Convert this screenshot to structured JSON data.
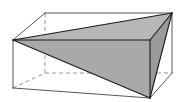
{
  "figure": {
    "background_color": "#ffffff",
    "canvas": {
      "width": 190,
      "height": 102
    },
    "colors": {
      "outline": "#1a1a1a",
      "hidden_edge": "#8a8a8a",
      "box_edge": "#444444",
      "face_top": "#b7b7b7",
      "face_front": "#a9a9a9",
      "face_right": "#9a9a9a",
      "face_left_sliver": "#8f8f8f"
    },
    "stroke_widths": {
      "solid": 1.1,
      "box": 0.9,
      "hidden": 0.9
    },
    "dash_pattern": "4,3",
    "vertices": {
      "box_front_top_left": [
        13,
        40
      ],
      "box_front_bottom_left": [
        13,
        88
      ],
      "box_front_top_right": [
        150,
        40
      ],
      "box_front_bottom_right": [
        150,
        98
      ],
      "box_back_top_left": [
        45,
        13
      ],
      "box_back_bottom_left": [
        45,
        73
      ],
      "box_back_top_right": [
        172,
        13
      ],
      "box_back_bottom_right": [
        172,
        73
      ],
      "prism_apex_left": [
        13,
        40
      ],
      "prism_vertex_top_right": [
        172,
        13
      ],
      "prism_vertex_front_right": [
        150,
        40
      ],
      "prism_vertex_bottom": [
        150,
        98
      ]
    },
    "faces": [
      {
        "name": "prism-top-face",
        "points": "13,40 172,13 150,40",
        "fill": "#b7b7b7"
      },
      {
        "name": "prism-front-face",
        "points": "13,40 150,40 150,98",
        "fill": "#a9a9a9"
      },
      {
        "name": "prism-right-face",
        "points": "172,13 150,40 150,98",
        "fill": "#9a9a9a"
      }
    ],
    "hidden_edges": [
      {
        "name": "hidden-edge-back-left-vertical",
        "x1": 45,
        "y1": 13,
        "x2": 45,
        "y2": 73
      },
      {
        "name": "hidden-edge-back-bottom-horizontal",
        "x1": 45,
        "y1": 73,
        "x2": 172,
        "y2": 73
      },
      {
        "name": "hidden-edge-bottom-left-diagonal",
        "x1": 13,
        "y1": 88,
        "x2": 45,
        "y2": 73
      }
    ],
    "box_edges": [
      {
        "name": "box-edge-front-left-vertical",
        "x1": 13,
        "y1": 40,
        "x2": 13,
        "y2": 88
      },
      {
        "name": "box-edge-front-bottom",
        "x1": 13,
        "y1": 88,
        "x2": 150,
        "y2": 98
      },
      {
        "name": "box-edge-front-right-vertical",
        "x1": 150,
        "y1": 40,
        "x2": 150,
        "y2": 98
      },
      {
        "name": "box-edge-top-left-diagonal",
        "x1": 13,
        "y1": 40,
        "x2": 45,
        "y2": 13
      },
      {
        "name": "box-edge-top-back",
        "x1": 45,
        "y1": 13,
        "x2": 172,
        "y2": 13
      },
      {
        "name": "box-edge-top-right-diagonal",
        "x1": 150,
        "y1": 40,
        "x2": 172,
        "y2": 13
      },
      {
        "name": "box-edge-back-right-vertical",
        "x1": 172,
        "y1": 13,
        "x2": 172,
        "y2": 73
      },
      {
        "name": "box-edge-bottom-right-diagonal",
        "x1": 150,
        "y1": 98,
        "x2": 172,
        "y2": 73
      }
    ],
    "prism_edges": [
      {
        "name": "prism-edge-apex-to-top-right",
        "x1": 13,
        "y1": 40,
        "x2": 172,
        "y2": 13
      },
      {
        "name": "prism-edge-apex-to-front-right",
        "x1": 13,
        "y1": 40,
        "x2": 150,
        "y2": 40
      },
      {
        "name": "prism-edge-apex-to-bottom",
        "x1": 13,
        "y1": 40,
        "x2": 150,
        "y2": 98
      },
      {
        "name": "prism-edge-top-right-to-front-right",
        "x1": 172,
        "y1": 13,
        "x2": 150,
        "y2": 40
      },
      {
        "name": "prism-edge-top-right-to-bottom",
        "x1": 172,
        "y1": 13,
        "x2": 150,
        "y2": 98
      },
      {
        "name": "prism-edge-front-right-to-bottom",
        "x1": 150,
        "y1": 40,
        "x2": 150,
        "y2": 98
      }
    ]
  }
}
